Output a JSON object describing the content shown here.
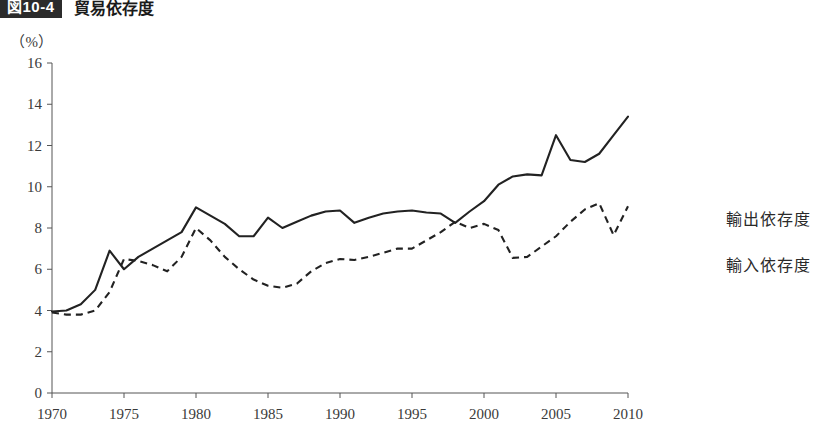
{
  "figure": {
    "badge": "図10-4",
    "title": "貿易依存度"
  },
  "axes": {
    "unit_label": "（%）",
    "y_ticks": [
      "0",
      "2",
      "4",
      "6",
      "8",
      "10",
      "12",
      "14",
      "16"
    ],
    "x_ticks": [
      "1970",
      "1975",
      "1980",
      "1985",
      "1990",
      "1995",
      "2000",
      "2005",
      "2010"
    ]
  },
  "legend": {
    "position": "right",
    "items": [
      {
        "label": "輸出依存度",
        "style": "dashed",
        "color": "#222222"
      },
      {
        "label": "輸入依存度",
        "style": "solid",
        "color": "#222222"
      }
    ]
  },
  "chart_data": {
    "type": "line",
    "title": "貿易依存度",
    "xlabel": "",
    "ylabel": "（%）",
    "xlim": [
      1970,
      2010
    ],
    "ylim": [
      0,
      16
    ],
    "grid": false,
    "legend_position": "right",
    "x": [
      1970,
      1971,
      1972,
      1973,
      1974,
      1975,
      1976,
      1977,
      1978,
      1979,
      1980,
      1981,
      1982,
      1983,
      1984,
      1985,
      1986,
      1987,
      1988,
      1989,
      1990,
      1991,
      1992,
      1993,
      1994,
      1995,
      1996,
      1997,
      1998,
      1999,
      2000,
      2001,
      2002,
      2003,
      2004,
      2005,
      2006,
      2007,
      2008,
      2009,
      2010
    ],
    "series": [
      {
        "name": "輸出依存度",
        "style": "dashed",
        "color": "#222222",
        "values": [
          3.9,
          3.8,
          3.8,
          4.0,
          4.9,
          6.5,
          6.4,
          6.2,
          5.9,
          6.6,
          8.0,
          7.4,
          6.6,
          6.0,
          5.5,
          5.2,
          5.1,
          5.3,
          5.9,
          6.3,
          6.5,
          6.45,
          6.6,
          6.8,
          7.0,
          7.0,
          7.4,
          7.8,
          8.3,
          8.0,
          8.2,
          7.9,
          6.55,
          6.6,
          7.1,
          7.6,
          8.3,
          8.9,
          9.2,
          7.65,
          9.05
        ]
      },
      {
        "name": "輸入依存度",
        "style": "solid",
        "color": "#222222",
        "values": [
          3.95,
          4.0,
          4.3,
          5.0,
          6.9,
          6.0,
          6.6,
          7.0,
          7.4,
          7.8,
          9.0,
          8.6,
          8.2,
          7.6,
          7.6,
          8.5,
          8.0,
          8.3,
          8.6,
          8.8,
          8.85,
          8.7,
          8.6,
          8.5,
          8.25,
          8.6,
          9.1,
          10.1,
          10.3,
          10.5,
          10.6,
          10.5,
          10.55,
          11.2,
          11.4,
          11.2,
          11.6,
          12.5,
          12.2,
          11.2,
          11.4
        ],
        "values_note": "series re-read below"
      }
    ]
  },
  "chart_series_solid_corrected": {
    "name": "輸入依存度",
    "values": [
      3.95,
      4.0,
      4.3,
      5.0,
      6.9,
      6.0,
      6.6,
      7.0,
      7.4,
      7.8,
      9.0,
      8.6,
      8.2,
      7.6,
      7.6,
      8.5,
      8.0,
      8.3,
      8.6,
      8.8,
      8.85,
      8.25,
      8.5,
      8.7,
      8.8,
      8.85,
      8.75,
      8.7,
      8.25,
      8.8,
      9.3,
      10.1,
      10.5,
      10.6,
      10.55,
      12.5,
      11.3,
      11.2,
      11.6,
      12.5,
      13.4
    ]
  }
}
